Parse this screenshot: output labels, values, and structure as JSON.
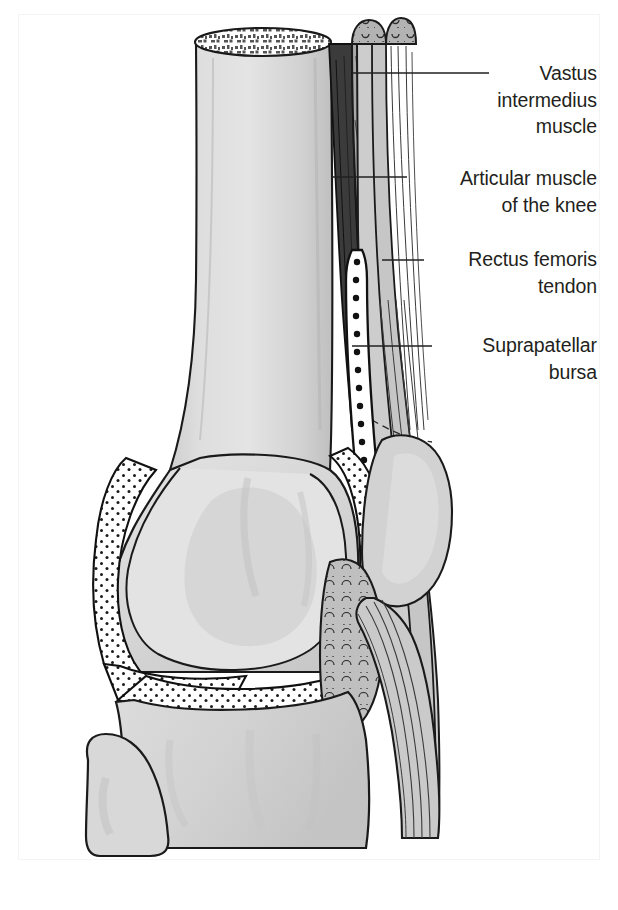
{
  "figure": {
    "kind": "anatomical-illustration",
    "view": "lateral / sagittal cut",
    "background_color": "#ffffff",
    "ink_color": "#231f20"
  },
  "labels": [
    {
      "id": "vastus-intermedius-muscle",
      "text": "Vastus\nintermedius\nmuscle",
      "leader": {
        "x1": 352,
        "y1": 73,
        "x2": 489,
        "y2": 73
      }
    },
    {
      "id": "articular-muscle-of-the-knee",
      "text": "Articular muscle\nof the knee",
      "leader": {
        "x1": 332,
        "y1": 177,
        "x2": 407,
        "y2": 177
      }
    },
    {
      "id": "rectus-femoris-tendon",
      "text": "Rectus femoris\ntendon",
      "leader": {
        "x1": 382,
        "y1": 260,
        "x2": 424,
        "y2": 260
      }
    },
    {
      "id": "suprapatellar-bursa",
      "text": "Suprapatellar\nbursa",
      "leader": {
        "x1": 352,
        "y1": 346,
        "x2": 432,
        "y2": 346
      }
    }
  ],
  "structures": [
    {
      "id": "femur-shaft",
      "name": "Femoral shaft (cut)",
      "fill": "#d5d5d5"
    },
    {
      "id": "cancellous-bone",
      "name": "Cancellous bone at cut end",
      "fill": "#ffffff"
    },
    {
      "id": "femoral-condyle",
      "name": "Femoral condyle",
      "fill": "#d8d8d8"
    },
    {
      "id": "articular-cartilage",
      "name": "Articular cartilage",
      "fill": "#e6e6e6"
    },
    {
      "id": "joint-space-stipple",
      "name": "Joint cavity (stippled)",
      "fill": "#ffffff"
    },
    {
      "id": "tibia",
      "name": "Tibia",
      "fill": "#d6d6d6"
    },
    {
      "id": "fibula-head",
      "name": "Head of fibula",
      "fill": "#d6d6d6"
    },
    {
      "id": "patella",
      "name": "Patella",
      "fill": "#d0d0d0"
    },
    {
      "id": "articular-muscle",
      "name": "Articular muscle of the knee",
      "fill": "#3a3a3a"
    },
    {
      "id": "vastus-intermedius",
      "name": "Vastus intermedius muscle",
      "fill": "#a9a9a9"
    },
    {
      "id": "rectus-femoris-tendon-s",
      "name": "Rectus femoris tendon",
      "fill": "#c9c9c9"
    },
    {
      "id": "suprapatellar-bursa-s",
      "name": "Suprapatellar bursa",
      "fill": "#ffffff"
    },
    {
      "id": "infrapatellar-fat-pad",
      "name": "Infrapatellar fat pad",
      "fill": "#bdbdbd"
    },
    {
      "id": "patellar-ligament",
      "name": "Patellar ligament",
      "fill": "#cccccc"
    }
  ]
}
